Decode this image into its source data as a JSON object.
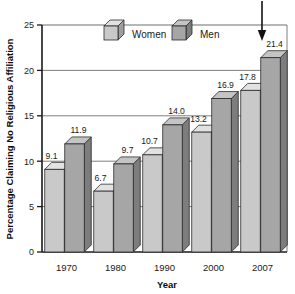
{
  "chart_data": {
    "type": "bar",
    "title": "",
    "xlabel": "Year",
    "ylabel": "Percentage Claiming No Religious Affiliation",
    "categories": [
      "1970",
      "1980",
      "1990",
      "2000",
      "2007"
    ],
    "series": [
      {
        "name": "Women",
        "values": [
          9.1,
          6.7,
          10.7,
          13.2,
          17.8
        ],
        "color": "#c9c9c9"
      },
      {
        "name": "Men",
        "values": [
          11.9,
          9.7,
          14.0,
          16.9,
          21.4
        ],
        "color": "#a6a6a6"
      }
    ],
    "value_labels": {
      "Women": [
        "9.1",
        "6.7",
        "10.7",
        "13.2",
        "17.8"
      ],
      "Men": [
        "11.9",
        "9.7",
        "14.0",
        "16.9",
        "21.4"
      ]
    },
    "ylim": [
      0,
      25
    ],
    "yticks": [
      0,
      5,
      10,
      15,
      20,
      25
    ],
    "ytick_labels": [
      "0",
      "5",
      "10",
      "15",
      "20",
      "25"
    ],
    "grid": "horizontal",
    "legend_position": "top-center",
    "style": "3d-bars",
    "annotations": [
      {
        "type": "arrow",
        "direction": "down",
        "target": "2007-men-bar",
        "label": ""
      }
    ]
  },
  "legend": {
    "items": [
      {
        "label": "Women",
        "swatch": "cube-light-icon"
      },
      {
        "label": "Men",
        "swatch": "cube-dark-icon"
      }
    ]
  },
  "axes": {
    "y_title": "Percentage Claiming No Religious Affiliation",
    "x_title": "Year"
  },
  "colors": {
    "women_front": "#c9c9c9",
    "women_top": "#e2e2e2",
    "women_side": "#9e9e9e",
    "men_front": "#a6a6a6",
    "men_top": "#c4c4c4",
    "men_side": "#7d7d7d",
    "outline": "#2b2b2b",
    "grid": "#6f6f6f",
    "axis": "#1a1a1a",
    "background": "#ffffff"
  }
}
